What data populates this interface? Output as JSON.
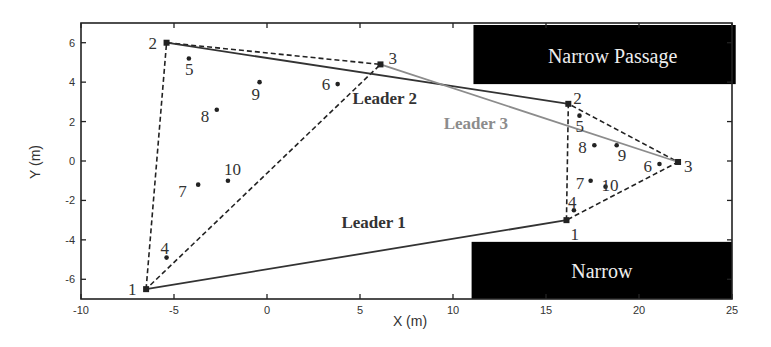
{
  "chart_data": {
    "type": "scatter",
    "title": "",
    "xlabel": "X (m)",
    "ylabel": "Y (m)",
    "xlim": [
      -10,
      25
    ],
    "ylim": [
      -7,
      7
    ],
    "xticks": [
      -10,
      -5,
      0,
      5,
      10,
      15,
      20,
      25
    ],
    "yticks": [
      -6,
      -4,
      -2,
      0,
      2,
      4,
      6
    ],
    "grid": false,
    "obstacles": [
      {
        "label": "Narrow Passage",
        "x0": 11.1,
        "x1": 25.2,
        "y0": 3.9,
        "y1": 7.0,
        "color": "#000000"
      },
      {
        "label": "Narrow",
        "x0": 11.0,
        "x1": 25.0,
        "y0": -7.0,
        "y1": -4.0,
        "color": "#000000"
      }
    ],
    "formations": [
      {
        "name": "initial",
        "leaders": [
          {
            "id": "1",
            "x": -6.5,
            "y": -6.5
          },
          {
            "id": "2",
            "x": -5.4,
            "y": 6.0
          },
          {
            "id": "3",
            "x": 6.1,
            "y": 4.9
          }
        ],
        "followers": [
          {
            "id": "4",
            "x": -5.4,
            "y": -4.9
          },
          {
            "id": "5",
            "x": -4.2,
            "y": 5.2
          },
          {
            "id": "6",
            "x": 3.8,
            "y": 3.9
          },
          {
            "id": "7",
            "x": -3.7,
            "y": -1.2
          },
          {
            "id": "8",
            "x": -2.7,
            "y": 2.6
          },
          {
            "id": "9",
            "x": -0.4,
            "y": 4.0
          },
          {
            "id": "10",
            "x": -2.1,
            "y": -1.0
          }
        ]
      },
      {
        "name": "final",
        "leaders": [
          {
            "id": "1",
            "x": 16.1,
            "y": -3.0
          },
          {
            "id": "2",
            "x": 16.2,
            "y": 2.9
          },
          {
            "id": "3",
            "x": 22.1,
            "y": -0.05
          }
        ],
        "followers": [
          {
            "id": "4",
            "x": 16.5,
            "y": -2.5
          },
          {
            "id": "5",
            "x": 16.8,
            "y": 2.3
          },
          {
            "id": "6",
            "x": 21.1,
            "y": -0.15
          },
          {
            "id": "7",
            "x": 17.4,
            "y": -1.0
          },
          {
            "id": "8",
            "x": 17.6,
            "y": 0.8
          },
          {
            "id": "9",
            "x": 18.8,
            "y": 0.8
          },
          {
            "id": "10",
            "x": 18.2,
            "y": -1.3
          }
        ]
      }
    ],
    "series": [
      {
        "name": "Leader 1",
        "color": "#333333",
        "x": [
          -6.5,
          16.1
        ],
        "y": [
          -6.5,
          -3.0
        ],
        "label_pos": [
          4.0,
          -3.4
        ]
      },
      {
        "name": "Leader 2",
        "color": "#333333",
        "x": [
          -5.4,
          16.2
        ],
        "y": [
          6.0,
          2.9
        ],
        "label_pos": [
          4.6,
          2.9
        ]
      },
      {
        "name": "Leader 3",
        "color": "#8c8c8c",
        "x": [
          6.1,
          22.1
        ],
        "y": [
          4.9,
          -0.05
        ],
        "label_pos": [
          9.5,
          1.6
        ]
      }
    ]
  }
}
